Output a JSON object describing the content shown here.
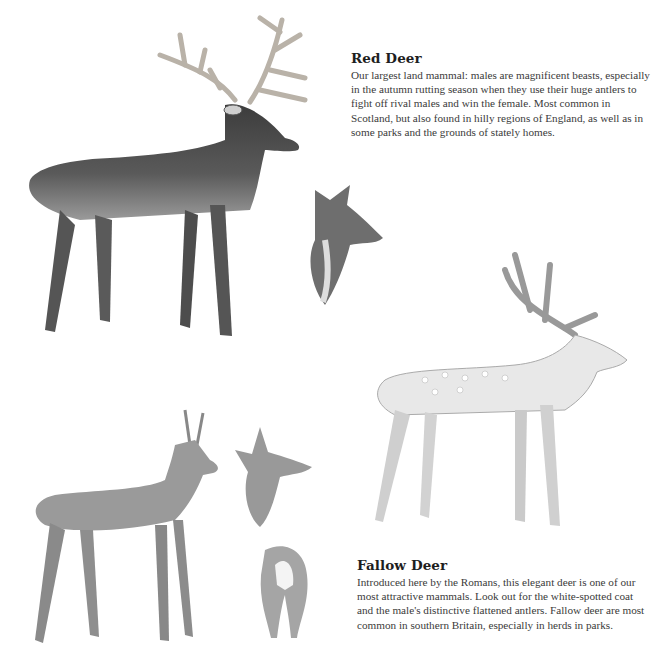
{
  "sections": {
    "red_deer": {
      "title": "Red Deer",
      "body": "Our largest land mammal: males are magnificent beasts, especially in the autumn rutting season when they use their huge antlers to fight off rival males and win the female. Most common in Scotland, but also found in hilly regions of England, as well as in some parks and the grounds of stately homes."
    },
    "fallow_deer": {
      "title": "Fallow Deer",
      "body": "Introduced here by the Romans, this elegant deer is one of our most attractive mammals. Look out for the white-spotted coat and the male's distinctive flattened antlers. Fallow deer are most common in southern Britain, especially in herds in parks."
    }
  },
  "illustrations": [
    {
      "name": "red-deer-stag",
      "tone": "#4a4a4a"
    },
    {
      "name": "red-deer-hind-head",
      "tone": "#6a6a6a"
    },
    {
      "name": "fallow-deer-buck",
      "tone": "#b8b8b8"
    },
    {
      "name": "roe-deer-buck",
      "tone": "#8a8a8a"
    },
    {
      "name": "roe-deer-doe-head",
      "tone": "#8a8a8a"
    },
    {
      "name": "roe-deer-rump",
      "tone": "#9a9a9a"
    }
  ]
}
